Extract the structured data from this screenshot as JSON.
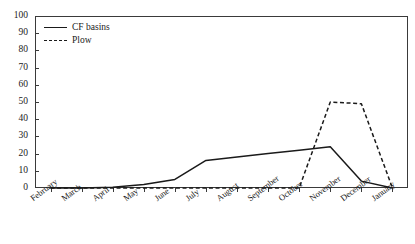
{
  "chart_data": {
    "type": "line",
    "title": "",
    "xlabel": "",
    "ylabel": "",
    "ylim": [
      0,
      100
    ],
    "ytick_step": 10,
    "grid": false,
    "legend_position": "top-left",
    "categories": [
      "February",
      "March",
      "April",
      "May",
      "June",
      "July",
      "August",
      "September",
      "October",
      "November",
      "December",
      "January"
    ],
    "yticks": [
      "0",
      "10",
      "20",
      "30",
      "40",
      "50",
      "60",
      "70",
      "80",
      "90",
      "100"
    ],
    "series": [
      {
        "name": "CF basins",
        "style": "solid",
        "color": "#1a1a1a",
        "values": [
          0,
          0,
          0.5,
          2,
          5,
          16,
          18,
          20,
          22,
          24,
          4,
          0
        ]
      },
      {
        "name": "Plow",
        "style": "dashed",
        "color": "#1a1a1a",
        "values": [
          0,
          0,
          0,
          0,
          0,
          0,
          0,
          0,
          0,
          50,
          49,
          0
        ]
      }
    ]
  },
  "legend": {
    "entries": [
      {
        "label": "CF basins"
      },
      {
        "label": "Plow"
      }
    ]
  }
}
